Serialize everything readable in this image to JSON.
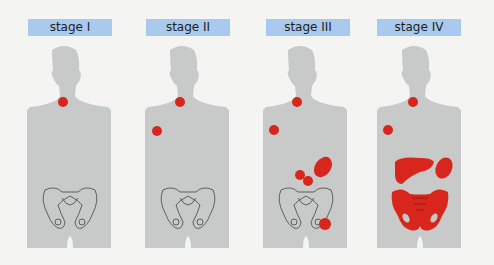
{
  "figure": {
    "type": "staging-diagram",
    "background": "#f4f4f2",
    "label_color": "#a9c9ee",
    "body_color": "#c8c9c9",
    "lesion_color": "#d9261c",
    "stages": [
      {
        "label": "stage I",
        "lesions": [
          "neck lymph node"
        ]
      },
      {
        "label": "stage II",
        "lesions": [
          "neck lymph node",
          "axillary lymph node"
        ]
      },
      {
        "label": "stage III",
        "lesions": [
          "neck lymph node",
          "axillary lymph node",
          "spleen",
          "abdominal lymph nodes",
          "inguinal lymph node"
        ]
      },
      {
        "label": "stage IV",
        "lesions": [
          "neck lymph node",
          "axillary lymph node",
          "liver",
          "spleen",
          "pelvic bone"
        ]
      }
    ]
  }
}
